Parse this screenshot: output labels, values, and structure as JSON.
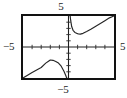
{
  "figure": {
    "kind": "graphing-calculator-plot",
    "labels": {
      "top": "5",
      "bottom": "−5",
      "left": "−5",
      "right": "5"
    }
  },
  "chart_data": {
    "type": "line",
    "title": "",
    "subtitle": "",
    "xlabel": "",
    "ylabel": "",
    "xlim": [
      -5,
      5
    ],
    "ylim": [
      -5,
      5
    ],
    "grid": false,
    "legend": null,
    "legend_position": "none",
    "axis_tick_labels": {
      "x": [
        "-5",
        "5"
      ],
      "y": [
        "-5",
        "5"
      ]
    },
    "x_tick_values": [
      -4,
      -3,
      -2,
      -1,
      1,
      2,
      3,
      4
    ],
    "y_tick_values": [
      -4,
      -3,
      -2,
      -1,
      1,
      2,
      3,
      4
    ],
    "vertical_asymptote": 0,
    "annotations": [
      "vertical asymptote at x = 0",
      "local maximum on left branch near (-2, -2.1)",
      "local minimum on right branch near (1.3, 2.1)"
    ],
    "series": [
      {
        "name": "right branch",
        "x": [
          0.18,
          0.25,
          0.35,
          0.5,
          0.7,
          0.9,
          1.1,
          1.3,
          1.6,
          2.0,
          2.5,
          3.0,
          3.5,
          4.0,
          4.5,
          5.0
        ],
        "y": [
          5.0,
          4.2,
          3.3,
          2.7,
          2.35,
          2.2,
          2.1,
          2.08,
          2.2,
          2.5,
          2.9,
          3.35,
          3.8,
          4.25,
          4.7,
          5.0
        ]
      },
      {
        "name": "left branch",
        "x": [
          -5.0,
          -4.5,
          -4.0,
          -3.5,
          -3.0,
          -2.5,
          -2.2,
          -2.0,
          -1.7,
          -1.4,
          -1.1,
          -0.8,
          -0.5,
          -0.3,
          -0.2,
          -0.15
        ],
        "y": [
          -5.0,
          -4.55,
          -4.1,
          -3.7,
          -3.3,
          -2.6,
          -2.3,
          -2.1,
          -2.15,
          -2.35,
          -2.6,
          -3.1,
          -3.9,
          -4.6,
          -5.0,
          -5.0
        ]
      }
    ]
  }
}
